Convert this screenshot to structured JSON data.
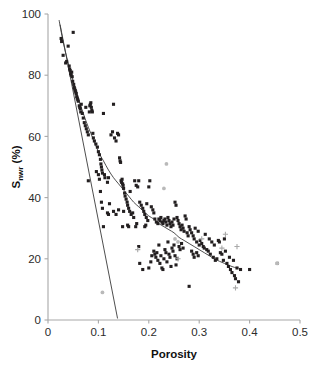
{
  "chart_data": {
    "type": "scatter",
    "title": "",
    "subtitle": "",
    "xlabel": "Porosity",
    "ylabel_main": "S",
    "ylabel_subscript": "nwr",
    "ylabel_unit": "(%)",
    "ylabel": "S_nwr (%)",
    "xlim": [
      0,
      0.5
    ],
    "ylim": [
      0,
      100
    ],
    "xticks": [
      0,
      0.1,
      0.2,
      0.3,
      0.4,
      0.5
    ],
    "xtick_labels": [
      "0",
      "0.1",
      "0.2",
      "0.3",
      "0.4",
      "0.5"
    ],
    "yticks": [
      0,
      20,
      40,
      60,
      80,
      100
    ],
    "ytick_labels": [
      "0",
      "20",
      "40",
      "60",
      "80",
      "100"
    ],
    "grid": false,
    "legend": false,
    "legend_position": "none",
    "colors": {
      "dark_marker": "#231f20",
      "gray_marker": "#b9b9b9",
      "plus_marker": "#a9a9a9",
      "axis": "#a8a8a8",
      "curve": "#3a3a3a",
      "text": "#111111"
    },
    "annotations": [],
    "series": [
      {
        "name": "dark-markers",
        "marker": "square-small",
        "color": "#231f20",
        "points": [
          [
            0.026,
            92.0
          ],
          [
            0.027,
            91.0
          ],
          [
            0.03,
            86.5
          ],
          [
            0.035,
            84.0
          ],
          [
            0.037,
            84.5
          ],
          [
            0.04,
            89.5
          ],
          [
            0.042,
            83.0
          ],
          [
            0.043,
            82.0
          ],
          [
            0.044,
            81.5
          ],
          [
            0.045,
            80.5
          ],
          [
            0.046,
            80.0
          ],
          [
            0.047,
            81.0
          ],
          [
            0.048,
            79.5
          ],
          [
            0.049,
            78.0
          ],
          [
            0.05,
            94.0
          ],
          [
            0.051,
            77.0
          ],
          [
            0.052,
            76.0
          ],
          [
            0.053,
            75.5
          ],
          [
            0.054,
            75.0
          ],
          [
            0.055,
            74.5
          ],
          [
            0.056,
            74.0
          ],
          [
            0.057,
            73.0
          ],
          [
            0.058,
            72.5
          ],
          [
            0.059,
            72.0
          ],
          [
            0.06,
            71.5
          ],
          [
            0.062,
            70.0
          ],
          [
            0.063,
            69.5
          ],
          [
            0.064,
            69.0
          ],
          [
            0.065,
            68.0
          ],
          [
            0.066,
            70.5
          ],
          [
            0.068,
            67.5
          ],
          [
            0.07,
            66.0
          ],
          [
            0.072,
            64.5
          ],
          [
            0.074,
            63.5
          ],
          [
            0.075,
            69.5
          ],
          [
            0.076,
            62.5
          ],
          [
            0.078,
            61.5
          ],
          [
            0.08,
            60.5
          ],
          [
            0.082,
            68.0
          ],
          [
            0.083,
            70.0
          ],
          [
            0.084,
            70.5
          ],
          [
            0.085,
            71.0
          ],
          [
            0.086,
            69.5
          ],
          [
            0.087,
            68.5
          ],
          [
            0.088,
            68.0
          ],
          [
            0.089,
            61.0
          ],
          [
            0.09,
            59.5
          ],
          [
            0.092,
            58.5
          ],
          [
            0.08,
            45.5
          ],
          [
            0.095,
            57.5
          ],
          [
            0.098,
            56.5
          ],
          [
            0.1,
            55.0
          ],
          [
            0.102,
            54.0
          ],
          [
            0.104,
            52.5
          ],
          [
            0.105,
            51.0
          ],
          [
            0.106,
            50.0
          ],
          [
            0.107,
            49.0
          ],
          [
            0.108,
            48.0
          ],
          [
            0.11,
            67.5
          ],
          [
            0.112,
            47.5
          ],
          [
            0.113,
            46.5
          ],
          [
            0.104,
            42.0
          ],
          [
            0.106,
            38.5
          ],
          [
            0.108,
            36.5
          ],
          [
            0.11,
            30.5
          ],
          [
            0.118,
            35.0
          ],
          [
            0.12,
            34.5
          ],
          [
            0.125,
            60.5
          ],
          [
            0.128,
            61.5
          ],
          [
            0.13,
            70.5
          ],
          [
            0.132,
            59.5
          ],
          [
            0.135,
            58.5
          ],
          [
            0.138,
            61.0
          ],
          [
            0.14,
            60.5
          ],
          [
            0.142,
            53.0
          ],
          [
            0.143,
            52.0
          ],
          [
            0.144,
            51.5
          ],
          [
            0.145,
            45.5
          ],
          [
            0.146,
            45.0
          ],
          [
            0.147,
            46.0
          ],
          [
            0.148,
            44.5
          ],
          [
            0.149,
            44.0
          ],
          [
            0.15,
            43.0
          ],
          [
            0.152,
            41.5
          ],
          [
            0.153,
            40.5
          ],
          [
            0.155,
            39.5
          ],
          [
            0.157,
            38.5
          ],
          [
            0.158,
            37.5
          ],
          [
            0.16,
            36.5
          ],
          [
            0.162,
            35.5
          ],
          [
            0.163,
            42.0
          ],
          [
            0.165,
            34.5
          ],
          [
            0.168,
            35.0
          ],
          [
            0.17,
            33.5
          ],
          [
            0.158,
            31.0
          ],
          [
            0.16,
            30.5
          ],
          [
            0.172,
            45.5
          ],
          [
            0.175,
            44.0
          ],
          [
            0.178,
            43.5
          ],
          [
            0.18,
            45.5
          ],
          [
            0.182,
            38.5
          ],
          [
            0.185,
            37.5
          ],
          [
            0.188,
            36.5
          ],
          [
            0.19,
            35.5
          ],
          [
            0.192,
            34.5
          ],
          [
            0.195,
            33.5
          ],
          [
            0.196,
            38.0
          ],
          [
            0.198,
            32.5
          ],
          [
            0.2,
            43.5
          ],
          [
            0.202,
            45.5
          ],
          [
            0.205,
            37.0
          ],
          [
            0.208,
            36.0
          ],
          [
            0.21,
            35.0
          ],
          [
            0.212,
            33.0
          ],
          [
            0.215,
            32.0
          ],
          [
            0.218,
            31.5
          ],
          [
            0.22,
            33.0
          ],
          [
            0.222,
            32.5
          ],
          [
            0.224,
            33.5
          ],
          [
            0.226,
            32.0
          ],
          [
            0.228,
            31.5
          ],
          [
            0.23,
            32.5
          ],
          [
            0.232,
            33.0
          ],
          [
            0.234,
            32.0
          ],
          [
            0.236,
            31.0
          ],
          [
            0.238,
            33.5
          ],
          [
            0.24,
            32.5
          ],
          [
            0.242,
            31.5
          ],
          [
            0.244,
            30.5
          ],
          [
            0.246,
            32.0
          ],
          [
            0.248,
            31.0
          ],
          [
            0.25,
            33.0
          ],
          [
            0.252,
            38.5
          ],
          [
            0.254,
            37.5
          ],
          [
            0.256,
            33.5
          ],
          [
            0.258,
            32.5
          ],
          [
            0.26,
            31.5
          ],
          [
            0.262,
            30.5
          ],
          [
            0.264,
            29.5
          ],
          [
            0.266,
            31.0
          ],
          [
            0.268,
            30.0
          ],
          [
            0.27,
            29.0
          ],
          [
            0.272,
            34.0
          ],
          [
            0.274,
            33.0
          ],
          [
            0.276,
            28.5
          ],
          [
            0.278,
            27.5
          ],
          [
            0.28,
            30.5
          ],
          [
            0.282,
            29.5
          ],
          [
            0.285,
            28.5
          ],
          [
            0.288,
            27.5
          ],
          [
            0.29,
            26.5
          ],
          [
            0.292,
            30.0
          ],
          [
            0.295,
            25.5
          ],
          [
            0.298,
            29.0
          ],
          [
            0.3,
            24.5
          ],
          [
            0.302,
            26.0
          ],
          [
            0.305,
            25.0
          ],
          [
            0.308,
            24.0
          ],
          [
            0.31,
            23.5
          ],
          [
            0.312,
            28.0
          ],
          [
            0.315,
            23.0
          ],
          [
            0.318,
            22.5
          ],
          [
            0.32,
            26.5
          ],
          [
            0.322,
            21.5
          ],
          [
            0.325,
            25.5
          ],
          [
            0.328,
            20.5
          ],
          [
            0.33,
            24.5
          ],
          [
            0.332,
            19.5
          ],
          [
            0.335,
            20.0
          ],
          [
            0.338,
            26.0
          ],
          [
            0.34,
            25.5
          ],
          [
            0.342,
            22.0
          ],
          [
            0.345,
            21.5
          ],
          [
            0.348,
            19.5
          ],
          [
            0.35,
            26.5
          ],
          [
            0.352,
            22.5
          ],
          [
            0.355,
            18.5
          ],
          [
            0.358,
            17.5
          ],
          [
            0.36,
            20.5
          ],
          [
            0.362,
            16.5
          ],
          [
            0.365,
            15.5
          ],
          [
            0.368,
            19.5
          ],
          [
            0.37,
            14.5
          ],
          [
            0.372,
            13.5
          ],
          [
            0.375,
            17.0
          ],
          [
            0.378,
            12.5
          ],
          [
            0.382,
            16.5
          ],
          [
            0.4,
            16.5
          ],
          [
            0.21,
            22.5
          ],
          [
            0.212,
            21.5
          ],
          [
            0.214,
            20.5
          ],
          [
            0.216,
            22.0
          ],
          [
            0.218,
            19.5
          ],
          [
            0.22,
            24.5
          ],
          [
            0.222,
            18.5
          ],
          [
            0.224,
            21.0
          ],
          [
            0.226,
            17.0
          ],
          [
            0.228,
            16.5
          ],
          [
            0.23,
            20.0
          ],
          [
            0.232,
            23.0
          ],
          [
            0.234,
            22.0
          ],
          [
            0.236,
            19.0
          ],
          [
            0.238,
            25.5
          ],
          [
            0.24,
            21.5
          ],
          [
            0.242,
            20.5
          ],
          [
            0.244,
            17.5
          ],
          [
            0.246,
            23.5
          ],
          [
            0.248,
            22.5
          ],
          [
            0.25,
            24.5
          ],
          [
            0.252,
            21.0
          ],
          [
            0.254,
            18.0
          ],
          [
            0.256,
            20.0
          ],
          [
            0.18,
            24.0
          ],
          [
            0.182,
            18.5
          ],
          [
            0.188,
            16.5
          ],
          [
            0.2,
            17.0
          ],
          [
            0.204,
            19.0
          ],
          [
            0.206,
            21.0
          ],
          [
            0.28,
            11.0
          ],
          [
            0.455,
            18.5
          ],
          [
            0.148,
            30.5
          ],
          [
            0.15,
            35.5
          ],
          [
            0.118,
            45.0
          ],
          [
            0.12,
            46.5
          ],
          [
            0.122,
            38.0
          ],
          [
            0.102,
            46.0
          ],
          [
            0.1,
            47.5
          ],
          [
            0.096,
            48.5
          ],
          [
            0.13,
            35.5
          ],
          [
            0.135,
            34.5
          ],
          [
            0.14,
            36.0
          ],
          [
            0.174,
            30.5
          ],
          [
            0.176,
            31.5
          ],
          [
            0.192,
            30.5
          ],
          [
            0.194,
            31.0
          ],
          [
            0.26,
            24.0
          ],
          [
            0.262,
            23.0
          ],
          [
            0.265,
            25.0
          ],
          [
            0.268,
            23.5
          ],
          [
            0.285,
            22.5
          ],
          [
            0.288,
            21.5
          ],
          [
            0.29,
            20.5
          ],
          [
            0.295,
            22.0
          ],
          [
            0.298,
            21.0
          ]
        ]
      },
      {
        "name": "gray-circle-markers",
        "marker": "circle-small",
        "color": "#b9b9b9",
        "points": [
          [
            0.235,
            51.0
          ],
          [
            0.23,
            43.0
          ],
          [
            0.108,
            9.0
          ],
          [
            0.455,
            18.5
          ],
          [
            0.252,
            26.5
          ],
          [
            0.258,
            25.5
          ]
        ]
      },
      {
        "name": "gray-plus-markers",
        "marker": "plus",
        "color": "#a9a9a9",
        "points": [
          [
            0.305,
            26.5
          ],
          [
            0.345,
            23.5
          ],
          [
            0.375,
            24.0
          ],
          [
            0.372,
            10.5
          ],
          [
            0.352,
            28.0
          ],
          [
            0.178,
            23.0
          ],
          [
            0.258,
            20.0
          ]
        ]
      }
    ],
    "fit_curve": {
      "name": "power-law-fit",
      "description": "decaying trend line through scatter",
      "points": [
        [
          0.022,
          98.0
        ],
        [
          0.03,
          91.0
        ],
        [
          0.04,
          84.0
        ],
        [
          0.05,
          78.0
        ],
        [
          0.06,
          72.5
        ],
        [
          0.07,
          67.5
        ],
        [
          0.08,
          63.0
        ],
        [
          0.09,
          59.0
        ],
        [
          0.1,
          55.0
        ],
        [
          0.11,
          52.0
        ],
        [
          0.12,
          49.0
        ],
        [
          0.13,
          46.5
        ],
        [
          0.14,
          44.5
        ],
        [
          0.15,
          42.5
        ],
        [
          0.16,
          40.5
        ],
        [
          0.17,
          38.5
        ],
        [
          0.18,
          37.0
        ],
        [
          0.19,
          35.5
        ],
        [
          0.2,
          34.0
        ],
        [
          0.21,
          33.0
        ],
        [
          0.22,
          31.5
        ],
        [
          0.23,
          30.5
        ],
        [
          0.24,
          29.5
        ],
        [
          0.25,
          28.5
        ],
        [
          0.26,
          27.0
        ],
        [
          0.27,
          26.0
        ],
        [
          0.28,
          25.0
        ],
        [
          0.29,
          24.0
        ],
        [
          0.3,
          23.0
        ],
        [
          0.31,
          22.0
        ],
        [
          0.32,
          21.0
        ],
        [
          0.33,
          20.0
        ],
        [
          0.34,
          19.2
        ],
        [
          0.35,
          18.5
        ],
        [
          0.36,
          17.8
        ],
        [
          0.37,
          17.2
        ],
        [
          0.378,
          17.0
        ]
      ]
    },
    "fit_line": {
      "name": "steep-linear-fit",
      "description": "steep straight segment in upper-left region",
      "start": [
        0.024,
        96.5
      ],
      "end": [
        0.138,
        0.5
      ]
    }
  }
}
